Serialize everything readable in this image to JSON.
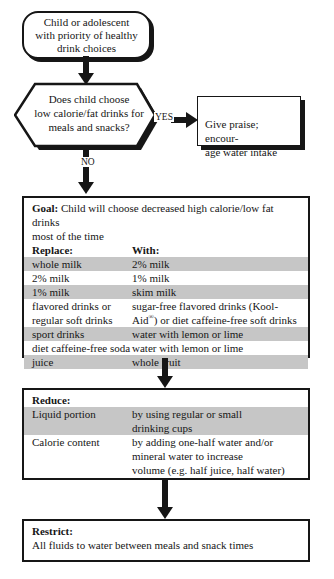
{
  "colors": {
    "shaded-row": "#c6c6c6",
    "ink": "#161616",
    "bg": "#ffffff"
  },
  "labels": {
    "yes": "YES",
    "no": "NO"
  },
  "start": {
    "lines": [
      "Child or adolescent",
      "with priority of healthy",
      "drink choices"
    ]
  },
  "decision": {
    "lines": [
      "Does child choose",
      "low calorie/fat drinks for",
      "meals and snacks?"
    ]
  },
  "praise": {
    "lines": [
      "Give praise; encour-",
      "age water intake"
    ]
  },
  "goal": {
    "title_bold": "Goal:",
    "title_rest": " Child will choose decreased high calorie/low fat drinks\nmost of the time",
    "col1_header": "Replace:",
    "col2_header": "With:",
    "rows": [
      {
        "replace": "whole milk",
        "with": "2% milk",
        "shaded": true
      },
      {
        "replace": "2% milk",
        "with": "1% milk",
        "shaded": false
      },
      {
        "replace": "1% milk",
        "with": "skim milk",
        "shaded": true
      },
      {
        "replace": [
          "flavored drinks or",
          "regular soft drinks"
        ],
        "with_pre": "sugar-free flavored drinks (Kool-\nAid",
        "with_sup": "®",
        "with_post": ") or diet caffeine-free soft drinks",
        "shaded": false
      },
      {
        "replace": "sport drinks",
        "with": "water with lemon or lime",
        "shaded": true
      },
      {
        "replace": "diet caffeine-free soda",
        "with": "water with lemon or lime",
        "shaded": false
      },
      {
        "replace": "juice",
        "with": "whole fruit",
        "shaded": true
      }
    ]
  },
  "reduce": {
    "heading": "Reduce:",
    "rows": [
      {
        "item": "Liquid portion",
        "method": [
          "by using regular or small",
          "drinking cups"
        ],
        "shaded": true
      },
      {
        "item": "Calorie content",
        "method": [
          "by adding one-half water and/or",
          "mineral water to increase",
          "volume (e.g. half juice, half water)"
        ],
        "shaded": false
      }
    ]
  },
  "restrict": {
    "heading": "Restrict:",
    "text": "All fluids to water between meals and snack times"
  }
}
